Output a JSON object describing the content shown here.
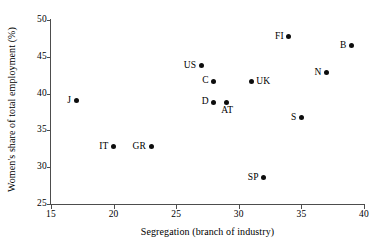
{
  "chart_data": {
    "type": "scatter",
    "title": "",
    "xlabel": "Segregation (branch of industry)",
    "ylabel": "Women's share of total employment (%)",
    "xlim": [
      15,
      40
    ],
    "ylim": [
      25,
      50
    ],
    "xticks": [
      "15",
      "20",
      "25",
      "30",
      "35",
      "40"
    ],
    "yticks": [
      "25",
      "30",
      "35",
      "40",
      "45",
      "50"
    ],
    "grid": false,
    "legend": "none",
    "marker_color": "#0d0d0d",
    "axis_color": "#4d4d4d",
    "points": [
      {
        "label": "J",
        "x": 17,
        "y": 39.0,
        "label_pos": "left"
      },
      {
        "label": "IT",
        "x": 20,
        "y": 32.8,
        "label_pos": "left"
      },
      {
        "label": "GR",
        "x": 23,
        "y": 32.8,
        "label_pos": "left"
      },
      {
        "label": "US",
        "x": 27,
        "y": 43.8,
        "label_pos": "left"
      },
      {
        "label": "C",
        "x": 28,
        "y": 41.7,
        "label_pos": "left"
      },
      {
        "label": "D",
        "x": 28,
        "y": 38.8,
        "label_pos": "left"
      },
      {
        "label": "AT",
        "x": 29,
        "y": 38.8,
        "label_pos": "below"
      },
      {
        "label": "UK",
        "x": 31,
        "y": 41.6,
        "label_pos": "right"
      },
      {
        "label": "SP",
        "x": 32,
        "y": 28.6,
        "label_pos": "left"
      },
      {
        "label": "FI",
        "x": 34,
        "y": 47.7,
        "label_pos": "left"
      },
      {
        "label": "S",
        "x": 35,
        "y": 36.7,
        "label_pos": "left"
      },
      {
        "label": "N",
        "x": 37,
        "y": 42.8,
        "label_pos": "left"
      },
      {
        "label": "B",
        "x": 39,
        "y": 46.5,
        "label_pos": "left"
      }
    ]
  }
}
